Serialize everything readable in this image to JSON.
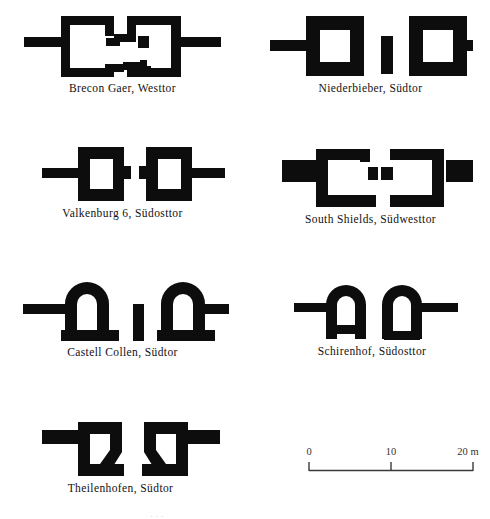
{
  "plate": {
    "type": "archaeological-plan-plate",
    "subject": "Roman fort gate ground plans",
    "background_color": "#ffffff",
    "ink_color": "#0d0d0d"
  },
  "figures": [
    {
      "id": "brecon",
      "caption": "Brecon Gaer, Westtor",
      "plan_type": "twin-tower-gate",
      "tower_form": "irregular-C-shaped-open-back",
      "has_central-spina": true
    },
    {
      "id": "niederbieber",
      "caption": "Niederbieber, Südtor",
      "plan_type": "twin-tower-gate",
      "tower_form": "rectangular-hollow",
      "has_central-spina": true
    },
    {
      "id": "valkenburg",
      "caption": "Valkenburg 6, Südosttor",
      "plan_type": "twin-tower-gate",
      "tower_form": "rectangular-hollow-small",
      "has_central-spina": false
    },
    {
      "id": "southshields",
      "caption": "South Shields, Südwesttor",
      "plan_type": "twin-tower-gate",
      "tower_form": "C-shaped-open-back",
      "has_central-spina": false
    },
    {
      "id": "castellcollen",
      "caption": "Castell Collen, Südtor",
      "plan_type": "twin-tower-gate",
      "tower_form": "apsidal-arched-front",
      "has_central-spina": true
    },
    {
      "id": "schirenhof",
      "caption": "Schirenhof, Südosttor",
      "plan_type": "twin-tower-gate",
      "tower_form": "apsidal-arched-front",
      "has_central-spina": false
    },
    {
      "id": "theilenhofen",
      "caption": "Theilenhofen, Südtor",
      "plan_type": "twin-tower-gate",
      "tower_form": "trapezoidal-chamfered",
      "has_central-spina": false
    }
  ],
  "scale": {
    "unit": "m",
    "ticks": [
      "0",
      "10",
      "20 m"
    ],
    "tick_values": [
      0,
      10,
      20
    ],
    "total_length_m": 20
  },
  "footer": {
    "cropped_text": "· · ·"
  }
}
